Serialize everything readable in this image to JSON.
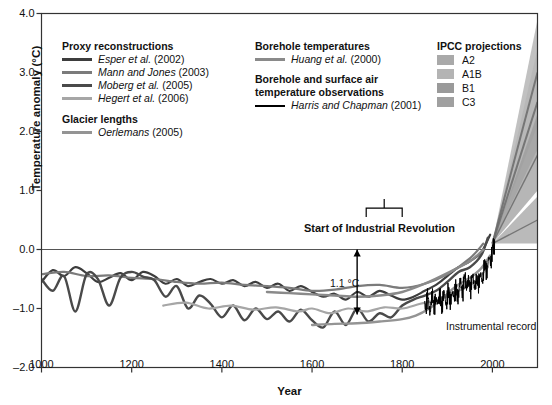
{
  "chart_data": {
    "type": "line",
    "title": "",
    "xlabel": "Year",
    "ylabel": "Temperature anomaly (°C)",
    "xlim": [
      1000,
      2100
    ],
    "ylim": [
      -2.0,
      4.0
    ],
    "xticks": [
      1000,
      1200,
      1400,
      1600,
      1800,
      2000
    ],
    "yticks": [
      "4.0",
      "3.0",
      "2.0",
      "1.0",
      "0.0",
      "-1.0",
      "-2.0"
    ],
    "grid": false,
    "zero_line": 0.0,
    "legend_position": "inside-top",
    "annotations": [
      {
        "text": "Start of Industrial Revolution",
        "x": 1760,
        "y": 0.55,
        "type": "bracket-label",
        "bracket_from": 1720,
        "bracket_to": 1800
      },
      {
        "text": "1.1 °C",
        "x": 1700,
        "y": -0.55,
        "type": "arrow-label",
        "arrow_from": 0.0,
        "arrow_to": -1.1
      },
      {
        "text": "Instrumental record",
        "x": 1930,
        "y": -0.95,
        "type": "text"
      }
    ],
    "series": [
      {
        "name": "Esper et al. (2002)",
        "group": "Proxy reconstructions",
        "color": "#3d3d3d",
        "width": 2.2,
        "x": [
          1000,
          1025,
          1050,
          1075,
          1100,
          1125,
          1150,
          1175,
          1200,
          1225,
          1250,
          1275,
          1300,
          1325,
          1350,
          1375,
          1400,
          1425,
          1450,
          1475,
          1500,
          1525,
          1550,
          1575,
          1600,
          1625,
          1650,
          1675,
          1700,
          1725,
          1750,
          1775,
          1800,
          1825,
          1850,
          1875,
          1900,
          1925,
          1950,
          1975,
          1995
        ],
        "y": [
          -0.55,
          -0.35,
          -0.45,
          -0.3,
          -0.4,
          -0.55,
          -0.48,
          -0.4,
          -0.52,
          -0.38,
          -0.45,
          -0.58,
          -0.5,
          -0.62,
          -0.55,
          -0.5,
          -0.58,
          -0.52,
          -0.62,
          -0.55,
          -0.65,
          -0.58,
          -0.7,
          -0.62,
          -0.72,
          -0.8,
          -0.75,
          -0.85,
          -0.72,
          -0.8,
          -0.7,
          -0.78,
          -0.85,
          -0.8,
          -0.7,
          -0.6,
          -0.45,
          -0.3,
          -0.2,
          -0.05,
          0.25
        ]
      },
      {
        "name": "Mann and Jones (2003)",
        "group": "Proxy reconstructions",
        "color": "#7b7b7b",
        "width": 2.2,
        "x": [
          1000,
          1050,
          1100,
          1150,
          1200,
          1250,
          1300,
          1350,
          1400,
          1450,
          1500,
          1550,
          1600,
          1650,
          1700,
          1750,
          1800,
          1850,
          1900,
          1950,
          1980
        ],
        "y": [
          -0.42,
          -0.38,
          -0.45,
          -0.44,
          -0.48,
          -0.5,
          -0.55,
          -0.58,
          -0.56,
          -0.6,
          -0.62,
          -0.65,
          -0.7,
          -0.68,
          -0.62,
          -0.6,
          -0.65,
          -0.58,
          -0.42,
          -0.15,
          0.1
        ]
      },
      {
        "name": "Moberg et al. (2005)",
        "group": "Proxy reconstructions",
        "color": "#4a4a4a",
        "width": 2.4,
        "x": [
          1000,
          1025,
          1050,
          1075,
          1100,
          1125,
          1150,
          1175,
          1200,
          1225,
          1250,
          1275,
          1300,
          1325,
          1350,
          1375,
          1400,
          1425,
          1450,
          1475,
          1500,
          1525,
          1550,
          1575,
          1600,
          1625,
          1650,
          1675,
          1700,
          1725,
          1750,
          1775,
          1800,
          1825,
          1850,
          1875,
          1900,
          1925,
          1950,
          1975,
          1990
        ],
        "y": [
          -0.5,
          -0.7,
          -0.45,
          -1.05,
          -0.42,
          -0.5,
          -0.95,
          -0.48,
          -0.38,
          -0.46,
          -0.52,
          -0.8,
          -0.62,
          -1.0,
          -0.78,
          -0.92,
          -1.15,
          -0.95,
          -1.2,
          -1.0,
          -1.18,
          -1.05,
          -1.22,
          -1.02,
          -1.2,
          -1.32,
          -1.05,
          -1.28,
          -1.0,
          -1.22,
          -1.08,
          -1.15,
          -0.95,
          -0.85,
          -0.78,
          -0.7,
          -0.55,
          -0.38,
          -0.3,
          -0.1,
          0.2
        ]
      },
      {
        "name": "Hegert et al. (2006)",
        "group": "Proxy reconstructions",
        "color": "#a6a6a6",
        "width": 2.2,
        "x": [
          1270,
          1320,
          1370,
          1420,
          1470,
          1520,
          1570,
          1600,
          1640,
          1680,
          1720,
          1760,
          1800,
          1840,
          1880,
          1920,
          1960,
          1990
        ],
        "y": [
          -0.95,
          -0.9,
          -1.0,
          -0.95,
          -1.02,
          -0.98,
          -1.05,
          -1.0,
          -1.08,
          -1.0,
          -1.05,
          -0.98,
          -1.0,
          -0.92,
          -0.85,
          -0.72,
          -0.55,
          -0.3
        ]
      },
      {
        "name": "Oerlemans (2005)",
        "group": "Glacier lengths",
        "color": "#949494",
        "width": 2.4,
        "x": [
          1600,
          1650,
          1700,
          1750,
          1800,
          1830,
          1860,
          1890,
          1920,
          1950,
          1975,
          1995
        ],
        "y": [
          -1.28,
          -1.26,
          -1.25,
          -1.22,
          -1.18,
          -1.12,
          -1.0,
          -0.82,
          -0.62,
          -0.48,
          -0.32,
          -0.1
        ]
      },
      {
        "name": "Huang et al. (2000)",
        "group": "Borehole temperatures",
        "color": "#8a8a8a",
        "width": 2.4,
        "x": [
          1500,
          1550,
          1600,
          1650,
          1700,
          1750,
          1800,
          1850,
          1900,
          1950,
          1980
        ],
        "y": [
          -0.72,
          -0.74,
          -0.76,
          -0.78,
          -0.8,
          -0.78,
          -0.72,
          -0.58,
          -0.4,
          -0.2,
          0.0
        ]
      },
      {
        "name": "Harris and Chapman (2001)",
        "group": "Borehole and surface air temperature observations",
        "color": "#000000",
        "width": 1.0,
        "x": [
          1850,
          1856,
          1862,
          1868,
          1874,
          1880,
          1886,
          1892,
          1898,
          1904,
          1910,
          1916,
          1922,
          1928,
          1934,
          1940,
          1946,
          1952,
          1958,
          1964,
          1970,
          1976,
          1982,
          1988,
          1994,
          2000,
          2005
        ],
        "y": [
          -0.95,
          -0.85,
          -1.0,
          -0.82,
          -0.95,
          -0.8,
          -0.92,
          -0.78,
          -0.88,
          -0.75,
          -0.85,
          -0.68,
          -0.78,
          -0.6,
          -0.68,
          -0.5,
          -0.62,
          -0.58,
          -0.52,
          -0.6,
          -0.48,
          -0.52,
          -0.32,
          -0.3,
          -0.18,
          -0.05,
          0.15
        ]
      }
    ],
    "projection_bands": [
      {
        "name": "A2",
        "color": "#a9a9a9",
        "start_year": 2000,
        "end_year": 2100,
        "start": 0.1,
        "high": 3.9,
        "low": 2.1,
        "mid": 3.0
      },
      {
        "name": "A1B",
        "color": "#b4b4b4",
        "start_year": 2000,
        "end_year": 2100,
        "start": 0.1,
        "high": 3.4,
        "low": 1.7,
        "mid": 2.5
      },
      {
        "name": "B1",
        "color": "#9a9a9a",
        "start_year": 2000,
        "end_year": 2100,
        "start": 0.1,
        "high": 2.3,
        "low": 1.0,
        "mid": 1.6
      },
      {
        "name": "C3",
        "color": "#a0a0a0",
        "start_year": 2000,
        "end_year": 2100,
        "start": 0.1,
        "high": 0.9,
        "low": 0.1,
        "mid": 0.5
      }
    ]
  },
  "axes": {
    "ylabel": "Temperature anomaly (°C)",
    "xlabel": "Year",
    "yticks": [
      {
        "label": "4.0"
      },
      {
        "label": "3.0"
      },
      {
        "label": "2.0"
      },
      {
        "label": "1.0"
      },
      {
        "label": "0.0"
      },
      {
        "label": "–1.0"
      },
      {
        "label": "–2.0"
      }
    ],
    "xticks": [
      {
        "label": "1000"
      },
      {
        "label": "1200"
      },
      {
        "label": "1400"
      },
      {
        "label": "1600"
      },
      {
        "label": "1800"
      },
      {
        "label": "2000"
      }
    ]
  },
  "legend": {
    "proxy": {
      "heading": "Proxy reconstructions",
      "items": [
        {
          "label": "Esper et al. (2002)",
          "italic": "Esper et al.",
          "rest": " (2002)",
          "color": "#3d3d3d",
          "weight": 3
        },
        {
          "label": "Mann and Jones (2003)",
          "italic": "Mann and Jones",
          "rest": " (2003)",
          "color": "#7b7b7b",
          "weight": 3
        },
        {
          "label": "Moberg et al. (2005)",
          "italic": "Moberg et al.",
          "rest": " (2005)",
          "color": "#4a4a4a",
          "weight": 3
        },
        {
          "label": "Hegert et al. (2006)",
          "italic": "Hegert et al.",
          "rest": " (2006)",
          "color": "#a6a6a6",
          "weight": 3
        }
      ]
    },
    "glacier": {
      "heading": "Glacier lengths",
      "items": [
        {
          "label": "Oerlemans (2005)",
          "italic": "Oerlemans",
          "rest": " (2005)",
          "color": "#949494",
          "weight": 3
        }
      ]
    },
    "borehole": {
      "heading": "Borehole temperatures",
      "items": [
        {
          "label": "Huang et al. (2000)",
          "italic": "Huang et al.",
          "rest": " (2000)",
          "color": "#8a8a8a",
          "weight": 3
        }
      ]
    },
    "surface": {
      "heading_line1": "Borehole and surface air",
      "heading_line2": "temperature observations",
      "items": [
        {
          "label": "Harris and Chapman (2001)",
          "italic": "Harris and Chapman",
          "rest": " (2001)",
          "color": "#000000",
          "weight": 2
        }
      ]
    },
    "ipcc": {
      "heading": "IPCC projections",
      "items": [
        {
          "label": "A2",
          "color": "#a9a9a9"
        },
        {
          "label": "A1B",
          "color": "#b4b4b4"
        },
        {
          "label": "B1",
          "color": "#9a9a9a"
        },
        {
          "label": "C3",
          "color": "#a0a0a0"
        }
      ]
    }
  },
  "annotations": {
    "industrial": "Start of Industrial Revolution",
    "delta": "1.1 °C",
    "instrumental": "Instrumental record"
  }
}
